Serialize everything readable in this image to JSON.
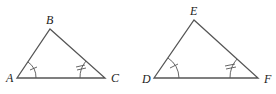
{
  "diagram": {
    "type": "similar-triangles",
    "triangles": [
      {
        "name": "triangle-abc",
        "vertices": [
          {
            "label": "A",
            "x": 17,
            "y": 78
          },
          {
            "label": "B",
            "x": 50,
            "y": 29
          },
          {
            "label": "C",
            "x": 105,
            "y": 78
          }
        ],
        "angle_marks": [
          {
            "vertex": "A",
            "ticks": 1
          },
          {
            "vertex": "C",
            "ticks": 2
          }
        ]
      },
      {
        "name": "triangle-def",
        "vertices": [
          {
            "label": "D",
            "x": 154,
            "y": 78
          },
          {
            "label": "E",
            "x": 194,
            "y": 20
          },
          {
            "label": "F",
            "x": 258,
            "y": 78
          }
        ],
        "angle_marks": [
          {
            "vertex": "D",
            "ticks": 1
          },
          {
            "vertex": "F",
            "ticks": 2
          }
        ]
      }
    ],
    "colors": {
      "stroke": "#555555",
      "label": "#222222"
    }
  }
}
